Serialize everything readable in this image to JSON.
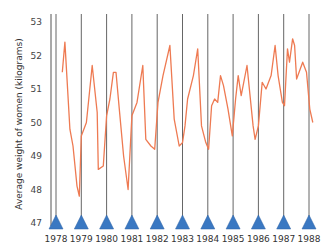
{
  "chart_data": {
    "type": "line",
    "title": "",
    "xlabel": "",
    "ylabel": "Average weight of women (kilograms)",
    "ylim": [
      47,
      53
    ],
    "xlim": [
      1978,
      1988
    ],
    "yticks": [
      47,
      48,
      49,
      50,
      51,
      52,
      53
    ],
    "xticks": [
      "1978",
      "1979",
      "1980",
      "1981",
      "1982",
      "1983",
      "1984",
      "1985",
      "1986",
      "1987",
      "1988"
    ],
    "grid": {
      "vertical_lines_at_years": true,
      "horizontal": false
    },
    "legend": null,
    "markers": {
      "shape": "triangle",
      "position": "x-axis at each year",
      "color": "#3a78c2"
    },
    "series": [
      {
        "name": "Average weight of women",
        "color": "#ee7a52",
        "x": [
          1978.25,
          1978.35,
          1978.55,
          1978.67,
          1978.83,
          1978.92,
          1979.0,
          1979.2,
          1979.43,
          1979.63,
          1979.67,
          1979.87,
          1980.0,
          1980.13,
          1980.27,
          1980.37,
          1980.5,
          1980.67,
          1980.85,
          1981.0,
          1981.2,
          1981.43,
          1981.55,
          1981.75,
          1981.9,
          1982.03,
          1982.23,
          1982.5,
          1982.67,
          1982.87,
          1983.0,
          1983.1,
          1983.2,
          1983.43,
          1983.6,
          1983.75,
          1983.92,
          1984.03,
          1984.15,
          1984.27,
          1984.39,
          1984.5,
          1984.62,
          1984.8,
          1984.97,
          1985.1,
          1985.2,
          1985.32,
          1985.55,
          1985.79,
          1985.87,
          1986.0,
          1986.15,
          1986.3,
          1986.5,
          1986.66,
          1986.78,
          1986.95,
          1987.03,
          1987.15,
          1987.23,
          1987.35,
          1987.43,
          1987.51,
          1987.75,
          1987.9,
          1988.03,
          1988.15
        ],
        "values": [
          51.5,
          52.4,
          49.8,
          49.3,
          48.1,
          47.8,
          49.6,
          50.0,
          51.7,
          50.3,
          48.6,
          48.7,
          50.2,
          50.7,
          51.5,
          51.5,
          50.4,
          49.0,
          48.0,
          50.2,
          50.6,
          51.7,
          49.5,
          49.3,
          49.2,
          50.6,
          51.4,
          52.3,
          50.1,
          49.3,
          49.4,
          49.9,
          50.7,
          51.4,
          52.2,
          49.9,
          49.4,
          49.2,
          50.5,
          50.7,
          50.6,
          51.4,
          51.1,
          50.4,
          49.6,
          50.7,
          51.4,
          50.8,
          51.7,
          49.9,
          49.5,
          49.9,
          51.2,
          51.0,
          51.4,
          52.3,
          51.4,
          50.6,
          50.5,
          52.2,
          51.8,
          52.5,
          52.3,
          51.3,
          51.8,
          51.5,
          50.4,
          50.0
        ]
      }
    ]
  }
}
